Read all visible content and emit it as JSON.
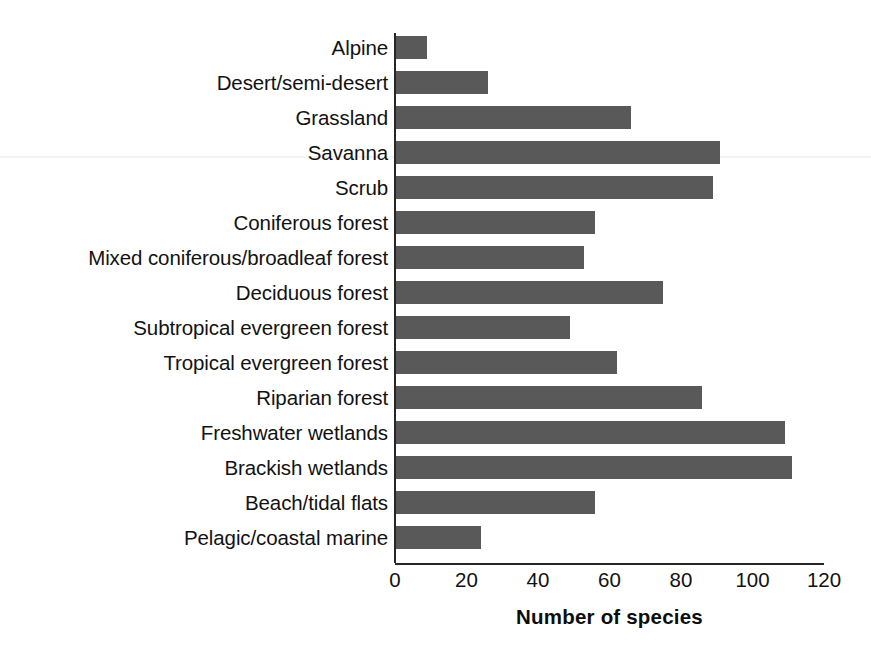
{
  "chart_data": {
    "type": "bar",
    "orientation": "horizontal",
    "title": "",
    "xlabel": "Number of species",
    "ylabel": "",
    "xlim": [
      0,
      120
    ],
    "xticks": [
      0,
      20,
      40,
      60,
      80,
      100,
      120
    ],
    "xtick_labels": [
      "0",
      "20",
      "40",
      "60",
      "80",
      "100",
      "120"
    ],
    "grid": false,
    "legend": null,
    "bar_color": "#595959",
    "axis_color": "#262626",
    "categories": [
      "Alpine",
      "Desert/semi-desert",
      "Grassland",
      "Savanna",
      "Scrub",
      "Coniferous forest",
      "Mixed coniferous/broadleaf forest",
      "Deciduous forest",
      "Subtropical evergreen forest",
      "Tropical evergreen forest",
      "Riparian forest",
      "Freshwater wetlands",
      "Brackish wetlands",
      "Beach/tidal flats",
      "Pelagic/coastal marine"
    ],
    "values": [
      9,
      26,
      66,
      91,
      89,
      56,
      53,
      75,
      49,
      62,
      86,
      109,
      111,
      56,
      24
    ]
  }
}
